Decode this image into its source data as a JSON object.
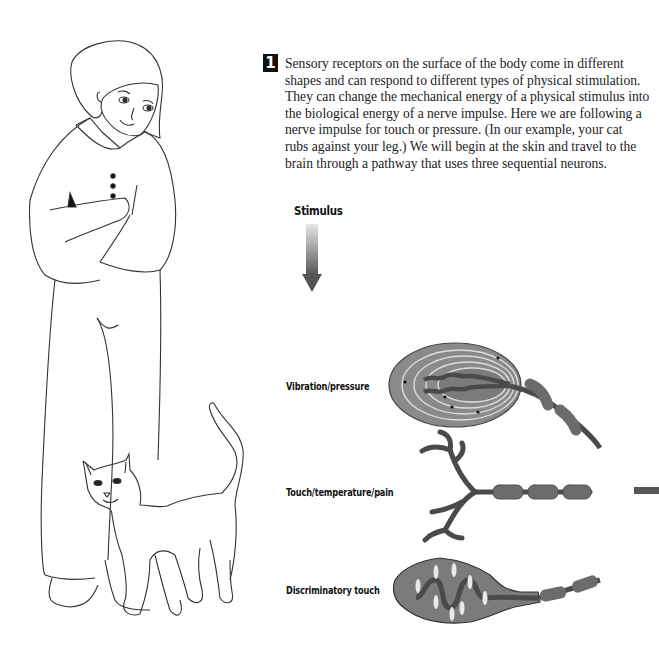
{
  "step": {
    "number": "1"
  },
  "paragraph": {
    "lines": [
      "Sensory receptors on the surface of the body come in different",
      "shapes and can respond to different types of physical stimulation.",
      "They can change the mechanical energy of a physical stimulus into",
      "the biological energy of a nerve impulse. Here we are following a",
      "nerve impulse for touch or pressure. (In our example, your cat",
      "rubs against your leg.) We will begin at the skin and travel to the",
      "brain through a pathway that uses three sequential neurons."
    ]
  },
  "stimulus": {
    "label": "Stimulus",
    "arrow_icon": "down-arrow-gradient"
  },
  "receptors": [
    {
      "label": "Vibration/pressure",
      "icon": "pacinian-corpuscle"
    },
    {
      "label": "Touch/temperature/pain",
      "icon": "free-nerve-ending"
    },
    {
      "label": "Discriminatory touch",
      "icon": "meissner-corpuscle"
    }
  ],
  "figures": {
    "person": "woman-with-crossed-arms",
    "animal": "cat-rubbing-leg"
  },
  "colors": {
    "neuron_dark": "#4a4a4a",
    "neuron_mid": "#6b6b6b",
    "capsule": "#8c8c8c",
    "line": "#333333",
    "badge": "#111111"
  }
}
